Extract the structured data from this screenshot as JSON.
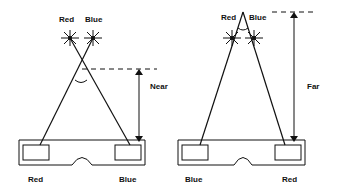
{
  "near_diagram": {
    "star_labels": {
      "left": "Red",
      "right": "Blue"
    },
    "distance_label": "Near",
    "lens_labels": {
      "left": "Red",
      "right": "Blue"
    }
  },
  "far_diagram": {
    "star_labels": {
      "left": "Red",
      "right": "Blue"
    },
    "distance_label": "Far",
    "lens_labels": {
      "left": "Blue",
      "right": "Red"
    }
  }
}
